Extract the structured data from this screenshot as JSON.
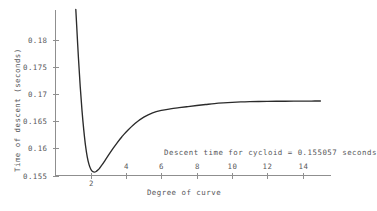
{
  "chart_data": {
    "type": "line",
    "title": "",
    "xlabel": "Degree of curve",
    "ylabel": "Time of descent (seconds)",
    "xlim": [
      0,
      15.6
    ],
    "ylim": [
      0.155,
      0.1855
    ],
    "grid": false,
    "legend": "none",
    "xticks": [
      {
        "value": 2,
        "label": "2",
        "position": "below-axis"
      },
      {
        "value": 4,
        "label": "4",
        "position": "above-axis"
      },
      {
        "value": 6,
        "label": "6",
        "position": "above-axis"
      },
      {
        "value": 8,
        "label": "8",
        "position": "above-axis"
      },
      {
        "value": 10,
        "label": "10",
        "position": "above-axis"
      },
      {
        "value": 12,
        "label": "12",
        "position": "above-axis"
      },
      {
        "value": 14,
        "label": "14",
        "position": "above-axis"
      }
    ],
    "yticks": [
      {
        "value": 0.18,
        "label": "0.18"
      },
      {
        "value": 0.175,
        "label": "0.175"
      },
      {
        "value": 0.17,
        "label": "0.17"
      },
      {
        "value": 0.165,
        "label": "0.165"
      },
      {
        "value": 0.16,
        "label": "0.16"
      },
      {
        "value": 0.155,
        "label": "0.155"
      }
    ],
    "annotations": [
      {
        "name": "cycloid-descent-time",
        "text": "Descent time for cycloid = 0.155057 seconds",
        "x": 6.0,
        "y": 0.1595
      }
    ],
    "series": [
      {
        "name": "time-of-descent",
        "color": "#2b2b2b",
        "x": [
          1.15,
          1.2,
          1.3,
          1.4,
          1.5,
          1.6,
          1.7,
          1.8,
          1.9,
          2.0,
          2.1,
          2.2,
          2.3,
          2.4,
          2.5,
          2.6,
          2.8,
          3.0,
          3.25,
          3.5,
          3.75,
          4.0,
          4.5,
          5.0,
          5.5,
          6.0,
          6.5,
          7.0,
          7.5,
          8.0,
          8.5,
          9.0,
          9.5,
          10.0,
          10.5,
          11.0,
          11.5,
          12.0,
          12.5,
          13.0,
          13.5,
          14.0,
          14.5,
          15.0
        ],
        "y": [
          0.1856,
          0.1826,
          0.1766,
          0.1714,
          0.167,
          0.1634,
          0.1605,
          0.1584,
          0.157,
          0.15615,
          0.15573,
          0.15562,
          0.15573,
          0.156,
          0.15637,
          0.1568,
          0.15776,
          0.15874,
          0.15994,
          0.16107,
          0.16209,
          0.16302,
          0.16458,
          0.16575,
          0.16655,
          0.167,
          0.16728,
          0.1675,
          0.1677,
          0.1679,
          0.16808,
          0.16825,
          0.16838,
          0.16848,
          0.16856,
          0.16861,
          0.16864,
          0.16866,
          0.16868,
          0.16869,
          0.1687,
          0.16871,
          0.16872,
          0.16873
        ]
      }
    ]
  },
  "axis_color": "#8f8f8f",
  "text_color": "#57575a"
}
